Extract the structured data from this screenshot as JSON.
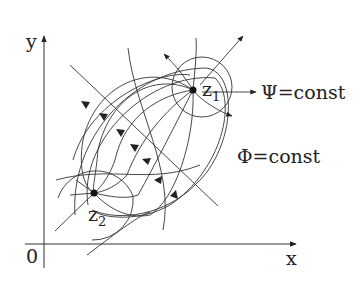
{
  "figure": {
    "axes": {
      "x_label": "x",
      "y_label": "y",
      "origin_label": "0"
    },
    "points": [
      {
        "id": "z1",
        "label": "z",
        "subscript": "1"
      },
      {
        "id": "z2",
        "label": "z",
        "subscript": "2"
      }
    ],
    "annotations": {
      "psi": "Ψ=const",
      "phi": "Φ=const"
    },
    "colors": {
      "line": "#333333",
      "background": "#ffffff"
    }
  }
}
